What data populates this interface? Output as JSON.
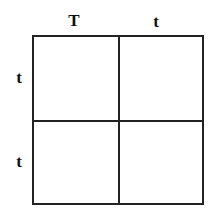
{
  "diagram": {
    "type": "punnett-square",
    "columns": [
      "T",
      "t"
    ],
    "rows": [
      "t",
      "t"
    ],
    "cells": [
      [
        "",
        ""
      ],
      [
        "",
        ""
      ]
    ],
    "line_color": "#222222"
  }
}
